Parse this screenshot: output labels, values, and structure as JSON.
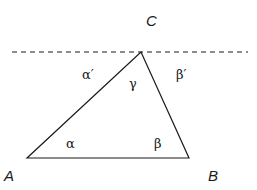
{
  "diagram": {
    "vertices": [
      {
        "id": "A",
        "label": "A",
        "x": 27,
        "y": 158,
        "label_x": 4,
        "label_y": 181
      },
      {
        "id": "B",
        "label": "B",
        "x": 189,
        "y": 158,
        "label_x": 208,
        "label_y": 181
      },
      {
        "id": "C",
        "label": "C",
        "x": 141,
        "y": 52,
        "label_x": 146,
        "label_y": 26
      }
    ],
    "angles": [
      {
        "id": "alpha",
        "label": "α",
        "x": 66,
        "y": 148
      },
      {
        "id": "beta",
        "label": "β",
        "x": 154,
        "y": 148
      },
      {
        "id": "gamma",
        "label": "γ",
        "x": 129,
        "y": 88
      },
      {
        "id": "alpha_prime",
        "label": "α′",
        "x": 82,
        "y": 79
      },
      {
        "id": "beta_prime",
        "label": "β′",
        "x": 176,
        "y": 79
      }
    ],
    "parallel_line": {
      "style": "dashed",
      "x1": 12,
      "y1": 52,
      "x2": 248,
      "y2": 52
    },
    "colors": {
      "stroke": "#1a1a1a",
      "background": "#ffffff"
    }
  }
}
